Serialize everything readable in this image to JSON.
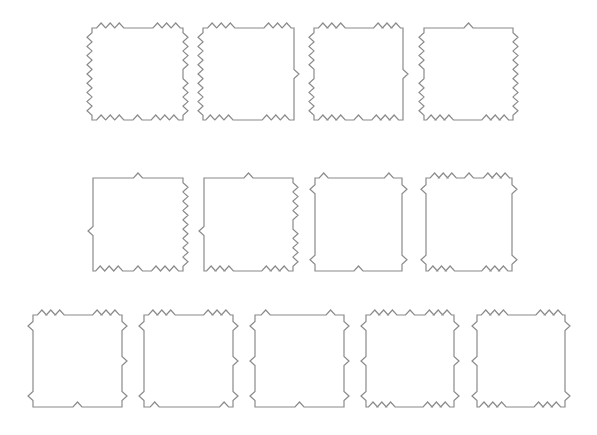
{
  "canvas": {
    "width": 597,
    "height": 435,
    "background": "#ffffff",
    "stroke": "#8a8a8a"
  },
  "bump": {
    "half_width": 4.5,
    "height": 5
  },
  "pieces": [
    {
      "id": "r1-p1",
      "x": 92,
      "y": 28,
      "w": 91,
      "h": 92,
      "top": {
        "dir": "out",
        "t": [
          0.1,
          0.2,
          0.3,
          0.72,
          0.82,
          0.92
        ]
      },
      "right": {
        "dir": "out",
        "t": [
          0.1,
          0.2,
          0.3,
          0.4,
          0.6,
          0.7,
          0.8,
          0.9
        ]
      },
      "bottom": {
        "dir": "in",
        "t": [
          0.1,
          0.2,
          0.3,
          0.5,
          0.7,
          0.8,
          0.9
        ]
      },
      "left": {
        "dir": "out",
        "t": [
          0.1,
          0.2,
          0.3,
          0.4,
          0.5,
          0.6,
          0.7,
          0.8,
          0.9
        ]
      }
    },
    {
      "id": "r1-p2",
      "x": 203,
      "y": 28,
      "w": 91,
      "h": 92,
      "top": {
        "dir": "out",
        "t": [
          0.1,
          0.2,
          0.3,
          0.72,
          0.82,
          0.92
        ]
      },
      "right": {
        "dir": "out",
        "t": [
          0.5
        ]
      },
      "bottom": {
        "dir": "in",
        "t": [
          0.1,
          0.2,
          0.3,
          0.72,
          0.82,
          0.92
        ]
      },
      "left": {
        "dir": "out",
        "t": [
          0.1,
          0.2,
          0.3,
          0.4,
          0.5,
          0.6,
          0.7,
          0.8,
          0.9
        ]
      }
    },
    {
      "id": "r1-p3",
      "x": 314,
      "y": 28,
      "w": 89,
      "h": 92,
      "top": {
        "dir": "out",
        "t": [
          0.1,
          0.2,
          0.3,
          0.72,
          0.82,
          0.92
        ]
      },
      "right": {
        "dir": "out",
        "t": [
          0.5
        ]
      },
      "bottom": {
        "dir": "in",
        "t": [
          0.1,
          0.2,
          0.3,
          0.5,
          0.7,
          0.8,
          0.9
        ]
      },
      "left": {
        "dir": "out",
        "t": [
          0.1,
          0.2,
          0.3,
          0.4,
          0.6,
          0.7,
          0.8,
          0.9
        ]
      }
    },
    {
      "id": "r1-p4",
      "x": 424,
      "y": 28,
      "w": 89,
      "h": 92,
      "top": {
        "dir": "out",
        "t": [
          0.5
        ]
      },
      "right": {
        "dir": "out",
        "t": [
          0.1,
          0.2,
          0.3,
          0.4,
          0.5,
          0.6,
          0.7,
          0.8,
          0.9
        ]
      },
      "bottom": {
        "dir": "in",
        "t": [
          0.1,
          0.2,
          0.3,
          0.72,
          0.82,
          0.92
        ]
      },
      "left": {
        "dir": "out",
        "t": [
          0.1,
          0.2,
          0.3,
          0.4,
          0.6,
          0.7,
          0.8,
          0.9
        ]
      }
    },
    {
      "id": "r2-p1",
      "x": 93,
      "y": 178,
      "w": 90,
      "h": 93,
      "top": {
        "dir": "out",
        "t": [
          0.5
        ]
      },
      "right": {
        "dir": "out",
        "t": [
          0.1,
          0.2,
          0.3,
          0.4,
          0.5,
          0.6,
          0.7,
          0.8,
          0.9
        ]
      },
      "bottom": {
        "dir": "in",
        "t": [
          0.1,
          0.2,
          0.3,
          0.5,
          0.72,
          0.82,
          0.92
        ]
      },
      "left": {
        "dir": "out",
        "t": [
          0.43
        ]
      }
    },
    {
      "id": "r2-p2",
      "x": 204,
      "y": 178,
      "w": 89,
      "h": 93,
      "top": {
        "dir": "out",
        "t": [
          0.5
        ]
      },
      "right": {
        "dir": "out",
        "t": [
          0.1,
          0.2,
          0.3,
          0.4,
          0.6,
          0.7,
          0.8,
          0.9
        ]
      },
      "bottom": {
        "dir": "in",
        "t": [
          0.1,
          0.2,
          0.3,
          0.72,
          0.82,
          0.92
        ]
      },
      "left": {
        "dir": "out",
        "t": [
          0.43
        ]
      }
    },
    {
      "id": "r2-p3",
      "x": 315,
      "y": 178,
      "w": 87,
      "h": 93,
      "top": {
        "dir": "out",
        "t": [
          0.1,
          0.85
        ]
      },
      "right": {
        "dir": "out",
        "t": [
          0.12,
          0.88
        ]
      },
      "bottom": {
        "dir": "in",
        "t": [
          0.5
        ]
      },
      "left": {
        "dir": "out",
        "t": [
          0.12,
          0.88
        ]
      }
    },
    {
      "id": "r2-p4",
      "x": 426,
      "y": 178,
      "w": 86,
      "h": 93,
      "top": {
        "dir": "out",
        "t": [
          0.1,
          0.2,
          0.3,
          0.5,
          0.72,
          0.82,
          0.92
        ]
      },
      "right": {
        "dir": "out",
        "t": [
          0.12,
          0.88
        ]
      },
      "bottom": {
        "dir": "in",
        "t": [
          0.1,
          0.2,
          0.3,
          0.72,
          0.82,
          0.92
        ]
      },
      "left": {
        "dir": "out",
        "t": [
          0.12,
          0.88
        ]
      }
    },
    {
      "id": "r3-p1",
      "x": 33,
      "y": 315,
      "w": 89,
      "h": 92,
      "top": {
        "dir": "out",
        "t": [
          0.1,
          0.2,
          0.3,
          0.72,
          0.82,
          0.92
        ]
      },
      "right": {
        "dir": "out",
        "t": [
          0.12,
          0.5,
          0.88
        ]
      },
      "bottom": {
        "dir": "in",
        "t": [
          0.5
        ]
      },
      "left": {
        "dir": "out",
        "t": [
          0.12,
          0.88
        ]
      }
    },
    {
      "id": "r3-p2",
      "x": 144,
      "y": 315,
      "w": 89,
      "h": 92,
      "top": {
        "dir": "out",
        "t": [
          0.1,
          0.2,
          0.3,
          0.72,
          0.82,
          0.92
        ]
      },
      "right": {
        "dir": "out",
        "t": [
          0.12,
          0.5,
          0.88
        ]
      },
      "bottom": {
        "dir": "in",
        "t": [
          0.1,
          0.88
        ]
      },
      "left": {
        "dir": "out",
        "t": [
          0.12,
          0.88
        ]
      }
    },
    {
      "id": "r3-p3",
      "x": 255,
      "y": 315,
      "w": 89,
      "h": 92,
      "top": {
        "dir": "out",
        "t": [
          0.12,
          0.85
        ]
      },
      "right": {
        "dir": "out",
        "t": [
          0.12,
          0.5,
          0.88
        ]
      },
      "bottom": {
        "dir": "in",
        "t": [
          0.5
        ]
      },
      "left": {
        "dir": "out",
        "t": [
          0.12,
          0.5,
          0.88
        ]
      }
    },
    {
      "id": "r3-p4",
      "x": 366,
      "y": 315,
      "w": 88,
      "h": 92,
      "top": {
        "dir": "out",
        "t": [
          0.1,
          0.2,
          0.3,
          0.5,
          0.72,
          0.82,
          0.92
        ]
      },
      "right": {
        "dir": "out",
        "t": [
          0.12,
          0.5,
          0.88
        ]
      },
      "bottom": {
        "dir": "in",
        "t": [
          0.1,
          0.2,
          0.3,
          0.72,
          0.82,
          0.92
        ]
      },
      "left": {
        "dir": "out",
        "t": [
          0.12,
          0.5,
          0.88
        ]
      }
    },
    {
      "id": "r3-p5",
      "x": 477,
      "y": 315,
      "w": 88,
      "h": 92,
      "top": {
        "dir": "out",
        "t": [
          0.1,
          0.2,
          0.3,
          0.72,
          0.82,
          0.92
        ]
      },
      "right": {
        "dir": "out",
        "t": [
          0.12,
          0.88
        ]
      },
      "bottom": {
        "dir": "in",
        "t": [
          0.1,
          0.2,
          0.3,
          0.72,
          0.82,
          0.92
        ]
      },
      "left": {
        "dir": "out",
        "t": [
          0.12,
          0.5,
          0.88
        ]
      }
    }
  ]
}
